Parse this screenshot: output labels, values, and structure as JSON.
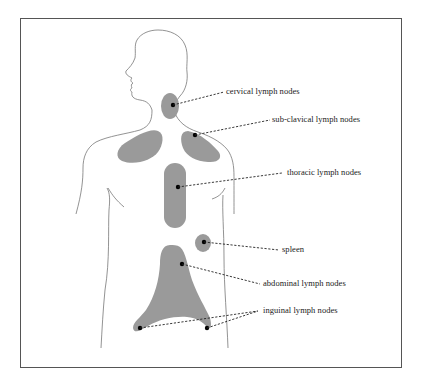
{
  "diagram": {
    "type": "anatomical-illustration",
    "colors": {
      "fill": "#9a9a9a",
      "outline": "#777777",
      "leader": "#222222",
      "frame": "#555555"
    },
    "labels": [
      {
        "id": "cervical",
        "text": "cervical lymph nodes"
      },
      {
        "id": "subclavical",
        "text": "sub-clavical lymph nodes"
      },
      {
        "id": "thoracic",
        "text": "thoracic lymph nodes"
      },
      {
        "id": "spleen",
        "text": "spleen"
      },
      {
        "id": "abdominal",
        "text": "abdominal lymph nodes"
      },
      {
        "id": "inguinal",
        "text": "inguinal lymph nodes"
      }
    ]
  }
}
